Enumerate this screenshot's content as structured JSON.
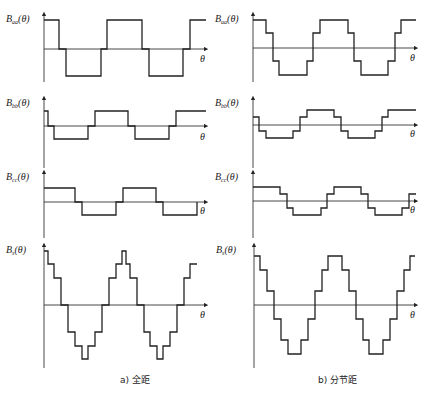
{
  "figure": {
    "captions": {
      "left": "a) 全距",
      "right": "b) 分节距"
    },
    "theta_label": "θ",
    "panels": [
      {
        "id": "aa-full",
        "label_main": "B",
        "label_sub": "aa",
        "label_tail": "(θ)",
        "ox": 44,
        "oy": 49,
        "ytop": 14,
        "ybot": 82,
        "xend": 206,
        "tx": 200,
        "ty": 62,
        "points": "44,20 59,20 59,49 66,49 66,76 101,76 101,49 107,49 107,20 142,20 142,49 149,49 149,76 183,76 183,49 190,49 190,20 206,20"
      },
      {
        "id": "aa-short",
        "label_main": "B",
        "label_sub": "aa",
        "label_tail": "(θ)",
        "ox": 253,
        "oy": 48,
        "ytop": 14,
        "ybot": 82,
        "xend": 416,
        "tx": 410,
        "ty": 61,
        "points": "253,20 266,20 266,33 273,33 273,61 279,61 279,75 307,75 307,61 313,61 313,33 320,33 320,20 348,20 348,33 354,33 354,61 361,61 361,75 388,75 388,61 395,61 395,33 401,33 401,20 416,20"
      },
      {
        "id": "bb-full",
        "label_main": "B",
        "label_sub": "bb",
        "label_tail": "(θ)",
        "ox": 44,
        "oy": 126,
        "ytop": 98,
        "ybot": 168,
        "xend": 206,
        "tx": 200,
        "ty": 140,
        "points": "44,111 48,111 48,126 54,126 54,139 88,139 88,126 95,126 95,111 128,111 128,126 135,126 135,139 169,139 169,126 176,126 176,111 206,111"
      },
      {
        "id": "bb-short",
        "label_main": "B",
        "label_sub": "bb",
        "label_tail": "(θ)",
        "ox": 253,
        "oy": 125,
        "ytop": 98,
        "ybot": 168,
        "xend": 416,
        "tx": 410,
        "ty": 137,
        "points": "253,117 259,117 259,131 266,131 266,138 293,138 293,131 300,131 300,117 307,117 307,110 334,110 334,117 341,117 341,131 348,131 348,138 375,138 375,131 382,131 382,117 388,117 388,110 416,110"
      },
      {
        "id": "cc-full",
        "label_main": "B",
        "label_sub": "cc",
        "label_tail": "(θ)",
        "ox": 44,
        "oy": 202,
        "ytop": 172,
        "ybot": 238,
        "xend": 206,
        "tx": 200,
        "ty": 214,
        "points": "44,188 75,188 75,202 82,202 82,215 116,215 116,202 123,202 123,188 156,188 156,202 163,202 163,215 197,215 197,202"
      },
      {
        "id": "cc-short",
        "label_main": "B",
        "label_sub": "cc",
        "label_tail": "(θ)",
        "ox": 253,
        "oy": 201,
        "ytop": 172,
        "ybot": 238,
        "xend": 416,
        "tx": 410,
        "ty": 213,
        "points": "253,187 280,187 280,194 287,194 287,208 293,208 293,215 321,215 321,208 327,208 327,194 334,194 334,187 361,187 361,194 368,194 368,208 375,208 375,215 402,215 402,208 409,208 409,194 416,194"
      },
      {
        "id": "s-full",
        "label_main": "B",
        "label_sub": "s",
        "label_tail": "(θ)",
        "ox": 44,
        "oy": 305,
        "ytop": 245,
        "ybot": 368,
        "xend": 206,
        "tx": 200,
        "ty": 318,
        "points": "44,251 48,251 48,264 54,264 54,278 61,278 61,305 68,305 68,332 75,332 75,346 82,346 82,359 88,359 88,346 95,346 95,332 102,332 102,305 109,305 109,278 116,278 116,264 122,264 122,251 126,251 126,264 130,264 130,278 137,278 137,305 144,305 144,332 150,332 150,346 157,346 157,359 163,359 163,346 170,346 170,332 177,332 177,305 184,305 184,278 190,278 190,264 197,264 197,264"
      },
      {
        "id": "s-short",
        "label_main": "B",
        "label_sub": "s",
        "label_tail": "(θ)",
        "ox": 254,
        "oy": 305,
        "ytop": 245,
        "ybot": 368,
        "xend": 416,
        "tx": 410,
        "ty": 318,
        "points": "254,256 260,256 260,270 267,270 267,291 274,291 274,319 281,319 281,340 288,340 288,354 301,354 301,340 308,340 308,319 315,319 315,291 322,291 322,270 328,270 328,256 342,256 342,270 349,270 349,291 356,291 356,319 363,319 363,340 369,340 369,354 383,354 383,340 390,340 390,319 397,319 397,291 404,291 404,270 410,270 410,256 415,256"
      }
    ]
  }
}
